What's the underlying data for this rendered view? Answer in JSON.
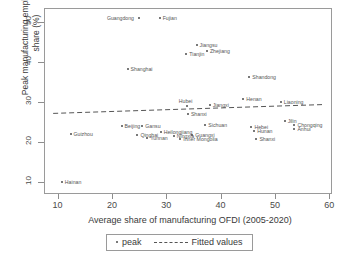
{
  "chart_data": {
    "type": "scatter",
    "title": "",
    "xlabel": "Average share of manufacturing OFDI  (2005-2020)",
    "ylabel": "Peak manufacturing employment\nshare (%)",
    "xlim": [
      7.5,
      60.5
    ],
    "ylim": [
      7.0,
      53.5
    ],
    "xticks": [
      10,
      20,
      30,
      40,
      50,
      60
    ],
    "yticks": [
      10,
      20,
      30,
      40,
      50
    ],
    "grid": false,
    "legend": {
      "position": "below-axis",
      "entries": [
        {
          "label": "peak",
          "marker": "dot"
        },
        {
          "label": "Fitted values",
          "marker": "dashed-line"
        }
      ]
    },
    "fit_line": {
      "label": "Fitted values",
      "style": "dashed",
      "x_start": 9.0,
      "y_start": 27.4,
      "x_end": 58.5,
      "y_end": 29.6
    },
    "points": [
      {
        "label": "Guangdong",
        "x": 24.8,
        "y": 51.3,
        "label_side": "left"
      },
      {
        "label": "Fujian",
        "x": 28.6,
        "y": 51.3,
        "label_side": "right"
      },
      {
        "label": "Jiangsu",
        "x": 35.4,
        "y": 44.4,
        "label_side": "right"
      },
      {
        "label": "Zhejiang",
        "x": 37.3,
        "y": 43.0,
        "label_side": "right"
      },
      {
        "label": "Tianjin",
        "x": 33.5,
        "y": 42.2,
        "label_side": "right"
      },
      {
        "label": "Shanghai",
        "x": 22.7,
        "y": 38.6,
        "label_side": "right"
      },
      {
        "label": "Shandong",
        "x": 45.1,
        "y": 36.4,
        "label_side": "right"
      },
      {
        "label": "Henan",
        "x": 44.0,
        "y": 31.1,
        "label_side": "right"
      },
      {
        "label": "Liaoning",
        "x": 50.9,
        "y": 30.2,
        "label_side": "right"
      },
      {
        "label": "Hubei",
        "x": 33.6,
        "y": 29.3,
        "label_side": "above"
      },
      {
        "label": "Jiangxi",
        "x": 37.8,
        "y": 29.5,
        "label_side": "right"
      },
      {
        "label": "Shanxi",
        "x": 33.8,
        "y": 27.2,
        "label_side": "right"
      },
      {
        "label": "Jilin",
        "x": 51.6,
        "y": 25.5,
        "label_side": "right"
      },
      {
        "label": "Chongqing",
        "x": 53.4,
        "y": 24.6,
        "label_side": "right"
      },
      {
        "label": "Anhui",
        "x": 53.4,
        "y": 23.6,
        "label_side": "right"
      },
      {
        "label": "Beijing",
        "x": 21.6,
        "y": 24.3,
        "label_side": "right"
      },
      {
        "label": "Gansu",
        "x": 25.4,
        "y": 24.3,
        "label_side": "right"
      },
      {
        "label": "Sichuan",
        "x": 37.0,
        "y": 24.4,
        "label_side": "right"
      },
      {
        "label": "Hebei",
        "x": 45.5,
        "y": 24.1,
        "label_side": "right"
      },
      {
        "label": "Hunan",
        "x": 46.0,
        "y": 23.0,
        "label_side": "right"
      },
      {
        "label": "Heilongjiang",
        "x": 28.8,
        "y": 22.8,
        "label_side": "right"
      },
      {
        "label": "Qinghai",
        "x": 24.5,
        "y": 22.1,
        "label_side": "right"
      },
      {
        "label": "Guizhou",
        "x": 12.2,
        "y": 22.3,
        "label_side": "right"
      },
      {
        "label": "Ningxia",
        "x": 31.2,
        "y": 21.8,
        "label_side": "right"
      },
      {
        "label": "Guangxi",
        "x": 34.6,
        "y": 22.1,
        "label_side": "right"
      },
      {
        "label": "Yunnan",
        "x": 26.3,
        "y": 21.2,
        "label_side": "right"
      },
      {
        "label": "Inner Mongolia",
        "x": 32.4,
        "y": 21.0,
        "label_side": "right"
      },
      {
        "label": "Shanxi",
        "x": 46.4,
        "y": 20.9,
        "label_side": "right"
      },
      {
        "label": "Hainan",
        "x": 10.6,
        "y": 10.3,
        "label_side": "right"
      }
    ]
  }
}
